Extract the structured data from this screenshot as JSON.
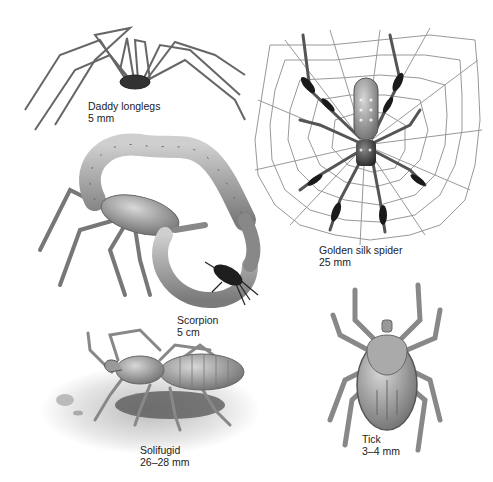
{
  "figure": {
    "specimens": [
      {
        "id": "daddy-longlegs",
        "name": "Daddy longlegs",
        "size": "5 mm"
      },
      {
        "id": "golden-silk-spider",
        "name": "Golden silk spider",
        "size": "25 mm"
      },
      {
        "id": "scorpion",
        "name": "Scorpion",
        "size": "5 cm"
      },
      {
        "id": "solifugid",
        "name": "Solifugid",
        "size": "26–28 mm"
      },
      {
        "id": "tick",
        "name": "Tick",
        "size": "3–4 mm"
      }
    ]
  }
}
